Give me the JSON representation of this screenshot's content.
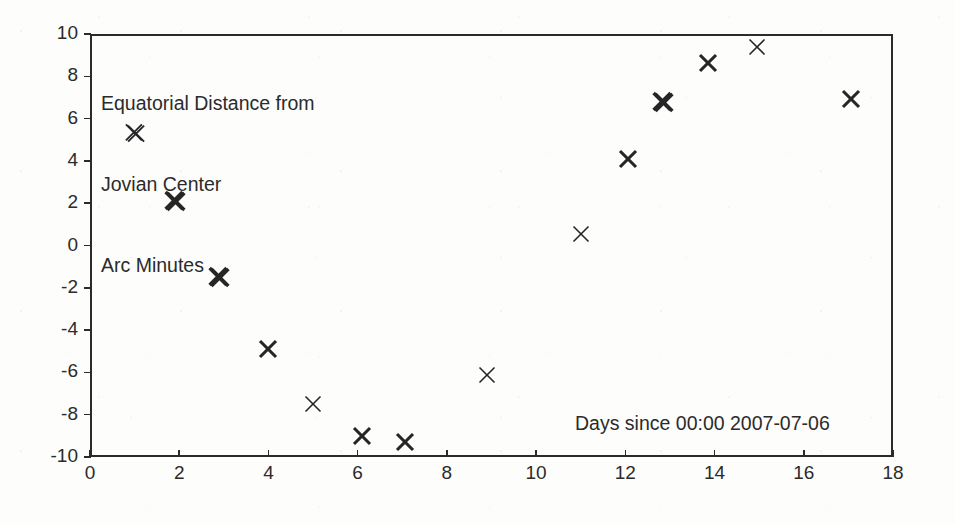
{
  "chart_data": {
    "type": "scatter",
    "title": "",
    "subtitle": "",
    "xlabel": "Days since 00:00 2007-07-06",
    "ylabel": "Equatorial Distance from Jovian Center Arc Minutes",
    "xlim": [
      0,
      18
    ],
    "ylim": [
      -10,
      10
    ],
    "xticks": [
      0,
      2,
      4,
      6,
      8,
      10,
      12,
      14,
      16,
      18
    ],
    "yticks": [
      -10,
      -8,
      -6,
      -4,
      -2,
      0,
      2,
      4,
      6,
      8,
      10
    ],
    "xtick_labels": [
      "0",
      "2",
      "4",
      "6",
      "8",
      "10",
      "12",
      "14",
      "16",
      "18"
    ],
    "ytick_labels": [
      "-10",
      "-8",
      "-6",
      "-4",
      "-2",
      "0",
      "2",
      "4",
      "6",
      "8",
      "10"
    ],
    "grid": false,
    "legend": null,
    "marker": "x",
    "marker_color": "#262626",
    "series": [
      {
        "name": "Equatorial distance",
        "points": [
          {
            "x": 1.0,
            "y": 5.3,
            "weight": "medium"
          },
          {
            "x": 1.9,
            "y": 2.1,
            "weight": "heavy"
          },
          {
            "x": 2.9,
            "y": -1.5,
            "weight": "heavy"
          },
          {
            "x": 4.0,
            "y": -4.9,
            "weight": "bold"
          },
          {
            "x": 5.0,
            "y": -7.5,
            "weight": "light"
          },
          {
            "x": 6.1,
            "y": -9.0,
            "weight": "bold"
          },
          {
            "x": 7.05,
            "y": -9.3,
            "weight": "bold"
          },
          {
            "x": 8.9,
            "y": -6.1,
            "weight": "light"
          },
          {
            "x": 11.0,
            "y": 0.55,
            "weight": "light"
          },
          {
            "x": 12.05,
            "y": 4.1,
            "weight": "bold"
          },
          {
            "x": 12.85,
            "y": 6.8,
            "weight": "heavy"
          },
          {
            "x": 13.85,
            "y": 8.65,
            "weight": "bold"
          },
          {
            "x": 14.95,
            "y": 9.4,
            "weight": "light"
          },
          {
            "x": 17.05,
            "y": 6.95,
            "weight": "bold"
          }
        ]
      }
    ]
  },
  "annotations": {
    "topleft_line1": "Equatorial Distance from",
    "topleft_line2": "Jovian Center",
    "topleft_line3": "Arc Minutes",
    "xaxis_caption": "Days since 00:00 2007-07-06"
  },
  "colors": {
    "axis": "#2b2b2b",
    "marker": "#262626",
    "text": "#2b2b2b",
    "background": "#fdfdfc"
  }
}
